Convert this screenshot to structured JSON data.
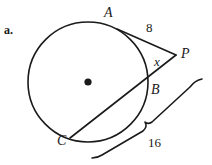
{
  "figure": {
    "item_label": "a.",
    "type": "circle-tangent-secant-diagram",
    "stroke_color": "#1a1a1a",
    "background_color": "#ffffff",
    "circle": {
      "center_dot": "center-point-dot",
      "cx": 88,
      "cy": 82,
      "r": 60
    },
    "points": {
      "A": "A",
      "B": "B",
      "C": "C",
      "P": "P"
    },
    "measures": {
      "tangent_PA": "8",
      "external_secant_PB": "x",
      "whole_secant_PC": "16"
    },
    "segments": [
      {
        "name": "tangent-PA",
        "from": "A",
        "to": "P"
      },
      {
        "name": "secant-PC",
        "from": "P",
        "to": "C"
      }
    ],
    "brace": {
      "name": "brace-PC",
      "label": "16",
      "spans": "from P to C"
    }
  }
}
